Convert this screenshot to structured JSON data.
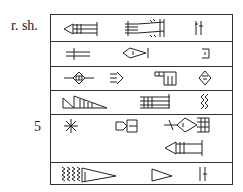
{
  "labels": {
    "reverse_shoulder": "r. sh.",
    "line_5": "5"
  },
  "table": {
    "rows": [
      {
        "index": 1,
        "signs": [
          "cuneiform-sign-1a",
          "cuneiform-sign-1b",
          "cuneiform-sign-1c"
        ]
      },
      {
        "index": 2,
        "signs": [
          "cuneiform-sign-2a",
          "cuneiform-sign-2b",
          "cuneiform-sign-2c"
        ]
      },
      {
        "index": 3,
        "signs": [
          "cuneiform-sign-3a",
          "cuneiform-sign-3b",
          "cuneiform-sign-3c",
          "cuneiform-sign-3d"
        ]
      },
      {
        "index": 4,
        "signs": [
          "cuneiform-sign-4a",
          "cuneiform-sign-4b",
          "cuneiform-sign-4c"
        ]
      },
      {
        "index": 5,
        "signs": [
          "cuneiform-sign-5a",
          "cuneiform-sign-5b",
          "cuneiform-sign-5c",
          "cuneiform-sign-5d"
        ]
      },
      {
        "index": 6,
        "signs": [
          "cuneiform-sign-6a",
          "cuneiform-sign-6b",
          "cuneiform-sign-6c"
        ]
      }
    ]
  }
}
